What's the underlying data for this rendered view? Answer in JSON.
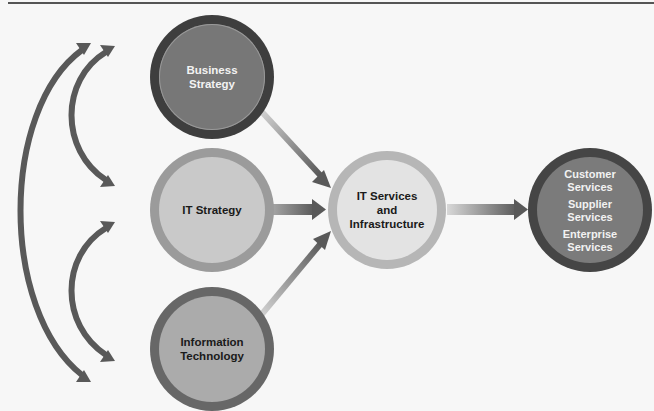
{
  "diagram": {
    "nodes": {
      "business_strategy": {
        "label": "Business\nStrategy",
        "lines": [
          "Business",
          "Strategy"
        ],
        "outer": "#3e3e3e",
        "inner": "#777777"
      },
      "it_strategy": {
        "label": "IT Strategy",
        "lines": [
          "IT Strategy"
        ],
        "outer": "#9b9b9b",
        "inner": "#c9c9c9"
      },
      "information_technology": {
        "label": "Information\nTechnology",
        "lines": [
          "Information",
          "Technology"
        ],
        "outer": "#676767",
        "inner": "#ababab"
      },
      "it_services": {
        "label": "IT Services and Infrastructure",
        "lines": [
          "IT Services",
          "and",
          "Infrastructure"
        ],
        "outer": "#b6b6b6",
        "inner": "#e3e3e3"
      },
      "services": {
        "groups": [
          {
            "lines": [
              "Customer",
              "Services"
            ]
          },
          {
            "lines": [
              "Supplier",
              "Services"
            ]
          },
          {
            "lines": [
              "Enterprise",
              "Services"
            ]
          }
        ],
        "outer": "#454545",
        "inner": "#7b7b7b"
      }
    },
    "edges": [
      {
        "from": "Business Strategy",
        "to": "IT Services and Infrastructure"
      },
      {
        "from": "IT Strategy",
        "to": "IT Services and Infrastructure"
      },
      {
        "from": "Information Technology",
        "to": "IT Services and Infrastructure"
      },
      {
        "from": "IT Services and Infrastructure",
        "to": "Customer Services / Supplier Services / Enterprise Services"
      },
      {
        "from": "Business Strategy",
        "to": "IT Strategy",
        "bidirectional": true
      },
      {
        "from": "IT Strategy",
        "to": "Information Technology",
        "bidirectional": true
      },
      {
        "from": "Business Strategy",
        "to": "Information Technology",
        "bidirectional": true
      }
    ],
    "arrow_color": "#5a5a5a"
  }
}
